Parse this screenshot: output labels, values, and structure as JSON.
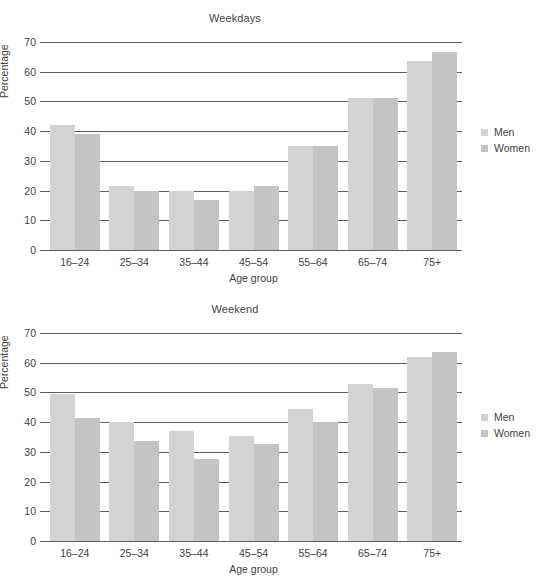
{
  "legend": {
    "position": "right",
    "entries": [
      {
        "label": "Men",
        "color": "#d3d3d3"
      },
      {
        "label": "Women",
        "color": "#c4c4c4"
      }
    ]
  },
  "axis": {
    "ylabel": "Percentage",
    "xlabel": "Age group",
    "yticks": [
      0,
      10,
      20,
      30,
      40,
      50,
      60,
      70
    ],
    "ylim": [
      0,
      70
    ],
    "categories": [
      "16–24",
      "25–34",
      "35–44",
      "45–54",
      "55–64",
      "65–74",
      "75+"
    ]
  },
  "chart_data": [
    {
      "type": "bar",
      "title": "Weekdays",
      "xlabel": "Age group",
      "ylabel": "Percentage",
      "ylim": [
        0,
        70
      ],
      "yticks": [
        0,
        10,
        20,
        30,
        40,
        50,
        60,
        70
      ],
      "grid": true,
      "legend_position": "right",
      "categories": [
        "16–24",
        "25–34",
        "35–44",
        "45–54",
        "55–64",
        "65–74",
        "75+"
      ],
      "series": [
        {
          "name": "Men",
          "color": "#d3d3d3",
          "values": [
            42,
            21.5,
            20,
            20,
            35,
            51,
            63.5
          ]
        },
        {
          "name": "Women",
          "color": "#c4c4c4",
          "values": [
            39,
            20,
            17,
            21.5,
            35,
            51,
            66.5
          ]
        }
      ]
    },
    {
      "type": "bar",
      "title": "Weekend",
      "xlabel": "Age group",
      "ylabel": "Percentage",
      "ylim": [
        0,
        70
      ],
      "yticks": [
        0,
        10,
        20,
        30,
        40,
        50,
        60,
        70
      ],
      "grid": true,
      "legend_position": "right",
      "categories": [
        "16–24",
        "25–34",
        "35–44",
        "45–54",
        "55–64",
        "65–74",
        "75+"
      ],
      "series": [
        {
          "name": "Men",
          "color": "#d3d3d3",
          "values": [
            49.5,
            40,
            37,
            35.5,
            44.5,
            53,
            62
          ]
        },
        {
          "name": "Women",
          "color": "#c4c4c4",
          "values": [
            41.5,
            33.5,
            27.5,
            32.5,
            40,
            51.5,
            63.5
          ]
        }
      ]
    }
  ]
}
